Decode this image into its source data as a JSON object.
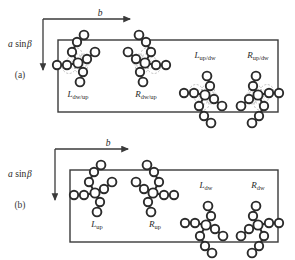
{
  "figure": {
    "background_color": "#ffffff",
    "line_color": "#3a3a3a",
    "atom_fill": "#ffffff",
    "atom_stroke": "#2b2b2b",
    "ghost_stroke": "#b9b9b9"
  },
  "axes": {
    "horizontal_label": "b",
    "vertical_label_prefix": "a",
    "vertical_label_func": "sin",
    "vertical_label_angle": "β"
  },
  "panels": [
    {
      "tag": "(a)",
      "tag_x": 20,
      "tag_y": 78,
      "box": {
        "x": 58,
        "y": 40,
        "w": 220,
        "h": 72
      },
      "axis_origin": {
        "x": 43,
        "y": 19
      },
      "axis_h_end": 130,
      "axis_v_end": 70,
      "b_label_x": 100,
      "b_label_y": 16,
      "asin_label_x": 8,
      "asin_label_y": 47,
      "molecules": [
        {
          "id": "L-dw-up",
          "cx": 78,
          "cy": 63,
          "flip_x": false,
          "flip_y": false,
          "ghost": true
        },
        {
          "id": "R-dw-up",
          "cx": 145,
          "cy": 63,
          "flip_x": true,
          "flip_y": false,
          "ghost": true
        },
        {
          "id": "L-up-dw",
          "cx": 205,
          "cy": 95,
          "flip_x": false,
          "flip_y": true,
          "ghost": true
        },
        {
          "id": "R-up-dw",
          "cx": 258,
          "cy": 95,
          "flip_x": true,
          "flip_y": true,
          "ghost": true
        }
      ],
      "labels": [
        {
          "base": "L",
          "sub": "dw/up",
          "x": 78,
          "y": 97
        },
        {
          "base": "R",
          "sub": "dw/up",
          "x": 146,
          "y": 97
        },
        {
          "base": "L",
          "sub": "up/dw",
          "x": 205,
          "y": 58
        },
        {
          "base": "R",
          "sub": "up/dw",
          "x": 258,
          "y": 58
        }
      ]
    },
    {
      "tag": "(b)",
      "tag_x": 20,
      "tag_y": 208,
      "box": {
        "x": 70,
        "y": 170,
        "w": 208,
        "h": 72
      },
      "axis_origin": {
        "x": 55,
        "y": 149
      },
      "axis_h_end": 128,
      "axis_v_end": 200,
      "b_label_x": 108,
      "b_label_y": 146,
      "asin_label_x": 8,
      "asin_label_y": 177,
      "molecules": [
        {
          "id": "L-up",
          "cx": 95,
          "cy": 193,
          "flip_x": false,
          "flip_y": false,
          "ghost": false
        },
        {
          "id": "R-up",
          "cx": 153,
          "cy": 193,
          "flip_x": true,
          "flip_y": false,
          "ghost": false
        },
        {
          "id": "L-dw",
          "cx": 206,
          "cy": 225,
          "flip_x": false,
          "flip_y": true,
          "ghost": false
        },
        {
          "id": "R-dw",
          "cx": 258,
          "cy": 225,
          "flip_x": true,
          "flip_y": true,
          "ghost": false
        }
      ],
      "labels": [
        {
          "base": "L",
          "sub": "up",
          "x": 97,
          "y": 227
        },
        {
          "base": "R",
          "sub": "up",
          "x": 155,
          "y": 227
        },
        {
          "base": "L",
          "sub": "dw",
          "x": 206,
          "y": 188
        },
        {
          "base": "R",
          "sub": "dw",
          "x": 258,
          "y": 188
        }
      ]
    }
  ]
}
